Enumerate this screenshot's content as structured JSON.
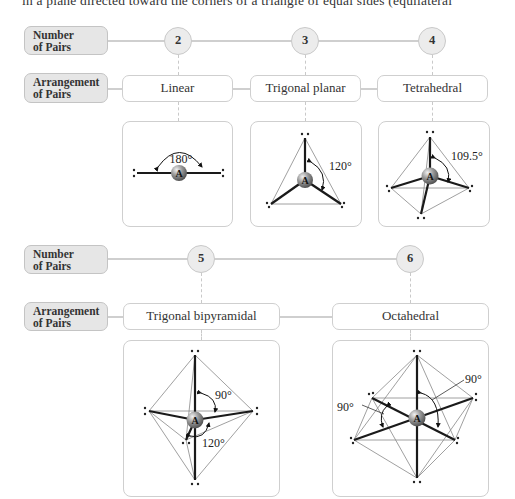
{
  "top_text": "in a plane directed toward the corners of a triangle of equal sides (equilateral",
  "row_labels": {
    "number": [
      "Number",
      "of Pairs"
    ],
    "arrangement": [
      "Arrangement",
      "of Pairs"
    ]
  },
  "section1": {
    "columns": [
      {
        "pairs": "2",
        "arrangement": "Linear",
        "angle": "180°"
      },
      {
        "pairs": "3",
        "arrangement": "Trigonal planar",
        "angle": "120°"
      },
      {
        "pairs": "4",
        "arrangement": "Tetrahedral",
        "angle": "109.5°"
      }
    ]
  },
  "section2": {
    "columns": [
      {
        "pairs": "5",
        "arrangement": "Trigonal bipyramidal",
        "angles": [
          "90°",
          "120°"
        ]
      },
      {
        "pairs": "6",
        "arrangement": "Octahedral",
        "angles": [
          "90°",
          "90°"
        ]
      }
    ]
  },
  "central_atom": "A",
  "colors": {
    "label_fill": "#e6e6e6",
    "border": "#cfcfcf",
    "bond": "#1a1a1a",
    "atom": "#8a8a8a"
  }
}
